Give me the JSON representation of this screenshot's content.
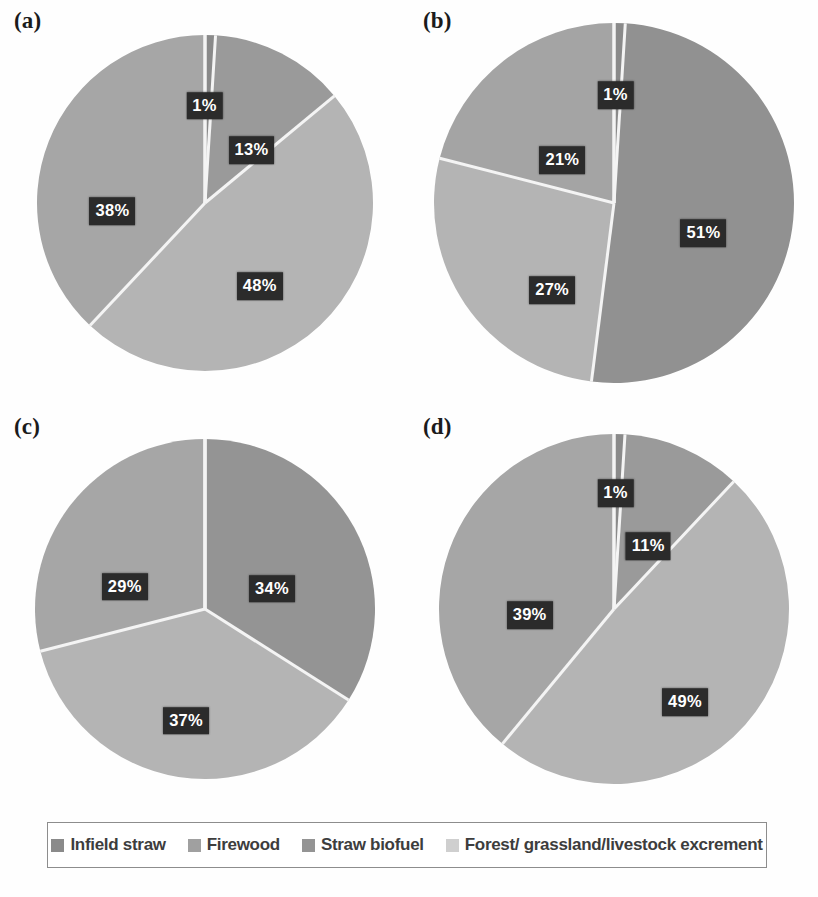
{
  "figure": {
    "background": "#fefefe",
    "label_box_color": "#2b2b2b",
    "label_text_color": "#ffffff",
    "separator_color": "#f4f4f4"
  },
  "legend": {
    "border_color": "#8d8d8d",
    "items": [
      {
        "label": "Infield straw",
        "color": "#8a8a8a",
        "swatch_name": "legend-swatch-infield-straw"
      },
      {
        "label": "Firewood",
        "color": "#a0a0a0",
        "swatch_name": "legend-swatch-firewood"
      },
      {
        "label": "Straw biofuel",
        "color": "#949494",
        "swatch_name": "legend-swatch-straw-biofuel"
      },
      {
        "label": "Forest/ grassland/livestock excrement",
        "color": "#cfcfcf",
        "swatch_name": "legend-swatch-forest-grassland"
      }
    ]
  },
  "chart_data": [
    {
      "type": "pie",
      "title": "(a)",
      "panel": "a",
      "categories": [
        "Infield straw",
        "Firewood",
        "Straw biofuel",
        "Forest/ grassland/livestock excrement"
      ],
      "values": [
        1,
        13,
        48,
        38
      ],
      "labels": [
        "1%",
        "13%",
        "48%",
        "38%"
      ],
      "colors": [
        "#8a8a8a",
        "#9a9a9a",
        "#b4b4b4",
        "#a6a6a6"
      ],
      "start_angle": 0,
      "legend_position": "bottom",
      "grid": false
    },
    {
      "type": "pie",
      "title": "(b)",
      "panel": "b",
      "categories": [
        "Infield straw",
        "Firewood",
        "Straw biofuel",
        "Forest/ grassland/livestock excrement"
      ],
      "values": [
        1,
        51,
        27,
        21
      ],
      "labels": [
        "1%",
        "51%",
        "27%",
        "21%"
      ],
      "colors": [
        "#8a8a8a",
        "#919191",
        "#b4b4b4",
        "#a4a4a4"
      ],
      "start_angle": 0,
      "legend_position": "bottom",
      "grid": false
    },
    {
      "type": "pie",
      "title": "(c)",
      "panel": "c",
      "categories": [
        "Infield straw",
        "Firewood",
        "Straw biofuel",
        "Forest/ grassland/livestock excrement"
      ],
      "values": [
        0,
        34,
        37,
        29
      ],
      "labels": [
        "",
        "34%",
        "37%",
        "29%"
      ],
      "colors": [
        "#8a8a8a",
        "#949494",
        "#b4b4b4",
        "#a6a6a6"
      ],
      "start_angle": 0,
      "legend_position": "bottom",
      "grid": false
    },
    {
      "type": "pie",
      "title": "(d)",
      "panel": "d",
      "categories": [
        "Infield straw",
        "Firewood",
        "Straw biofuel",
        "Forest/ grassland/livestock excrement"
      ],
      "values": [
        1,
        11,
        49,
        39
      ],
      "labels": [
        "1%",
        "11%",
        "49%",
        "39%"
      ],
      "colors": [
        "#8a8a8a",
        "#9a9a9a",
        "#b4b4b4",
        "#a6a6a6"
      ],
      "start_angle": 0,
      "legend_position": "bottom",
      "grid": false
    }
  ],
  "panels": [
    {
      "label": "(a)",
      "radius": 168,
      "labels": [
        {
          "text": "1%",
          "x": 50.0,
          "y": 26.0
        },
        {
          "text": "13%",
          "x": 61.5,
          "y": 37.0
        },
        {
          "text": "48%",
          "x": 63.5,
          "y": 70.5
        },
        {
          "text": "38%",
          "x": 27.5,
          "y": 52.0
        }
      ]
    },
    {
      "label": "(b)",
      "radius": 180,
      "labels": [
        {
          "text": "1%",
          "x": 50.5,
          "y": 23.5
        },
        {
          "text": "51%",
          "x": 72.0,
          "y": 57.5
        },
        {
          "text": "27%",
          "x": 35.0,
          "y": 71.5
        },
        {
          "text": "21%",
          "x": 37.5,
          "y": 39.5
        }
      ]
    },
    {
      "label": "(c)",
      "radius": 170,
      "labels": [
        {
          "text": "34%",
          "x": 66.5,
          "y": 45.0
        },
        {
          "text": "37%",
          "x": 45.5,
          "y": 77.5
        },
        {
          "text": "29%",
          "x": 30.5,
          "y": 44.5
        }
      ]
    },
    {
      "label": "(d)",
      "radius": 175,
      "labels": [
        {
          "text": "1%",
          "x": 50.5,
          "y": 21.5
        },
        {
          "text": "11%",
          "x": 58.5,
          "y": 34.5
        },
        {
          "text": "49%",
          "x": 67.5,
          "y": 73.0
        },
        {
          "text": "39%",
          "x": 29.5,
          "y": 51.5
        }
      ]
    }
  ]
}
